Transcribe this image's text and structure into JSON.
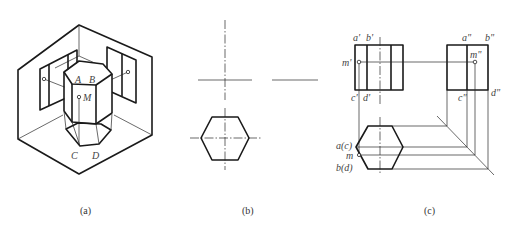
{
  "figure": {
    "panels": [
      {
        "id": "a",
        "caption": "(a)",
        "description": "Isometric view of hexagonal prism in three-plane projection box",
        "labels": {
          "A": "A",
          "B": "B",
          "M": "M",
          "C": "C",
          "D": "D"
        }
      },
      {
        "id": "b",
        "caption": "(b)",
        "description": "Top view of hexagonal prism with centerlines and projection axes"
      },
      {
        "id": "c",
        "caption": "(c)",
        "description": "Three-view orthographic projection with point M",
        "labels": {
          "a_front": "a'",
          "b_front": "b'",
          "m_front": "m'",
          "c_front": "c'",
          "d_front": "d'",
          "a_side": "a\"",
          "b_side": "b\"",
          "m_side": "m\"",
          "c_side": "c\"",
          "d_side": "d\"",
          "ac_top": "a(c)",
          "m_top": "m",
          "bd_top": "b(d)"
        }
      }
    ]
  }
}
